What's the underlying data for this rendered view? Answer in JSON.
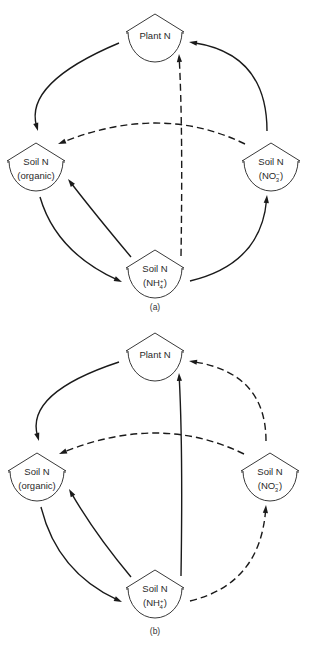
{
  "diagrams": [
    {
      "id": "a",
      "label": "(a)",
      "nodes": [
        {
          "id": "plant",
          "line1": "Plant N",
          "line2": ""
        },
        {
          "id": "organic",
          "line1": "Soil N",
          "line2": "(organic)"
        },
        {
          "id": "nitrate",
          "line1": "Soil N",
          "line2": "(NO",
          "ion_sup": "−",
          "ion_sub": "3",
          "line2_end": ")"
        },
        {
          "id": "ammonium",
          "line1": "Soil N",
          "line2": "(NH",
          "ion_sup": "+",
          "ion_sub": "4",
          "line2_end": ")"
        }
      ],
      "edges": [
        {
          "from": "plant",
          "to": "organic",
          "style": "solid"
        },
        {
          "from": "organic",
          "to": "ammonium",
          "style": "solid"
        },
        {
          "from": "ammonium",
          "to": "organic",
          "style": "solid"
        },
        {
          "from": "ammonium",
          "to": "nitrate",
          "style": "solid"
        },
        {
          "from": "nitrate",
          "to": "plant",
          "style": "solid"
        },
        {
          "from": "nitrate",
          "to": "organic",
          "style": "dashed"
        },
        {
          "from": "ammonium",
          "to": "plant",
          "style": "dashed"
        }
      ]
    },
    {
      "id": "b",
      "label": "(b)",
      "nodes": [
        {
          "id": "plant",
          "line1": "Plant N",
          "line2": ""
        },
        {
          "id": "organic",
          "line1": "Soil N",
          "line2": "(organic)"
        },
        {
          "id": "nitrate",
          "line1": "Soil N",
          "line2": "(NO",
          "ion_sup": "−",
          "ion_sub": "3",
          "line2_end": ")"
        },
        {
          "id": "ammonium",
          "line1": "Soil N",
          "line2": "(NH",
          "ion_sup": "+",
          "ion_sub": "4",
          "line2_end": ")"
        }
      ],
      "edges": [
        {
          "from": "plant",
          "to": "organic",
          "style": "solid"
        },
        {
          "from": "organic",
          "to": "ammonium",
          "style": "solid"
        },
        {
          "from": "ammonium",
          "to": "organic",
          "style": "solid"
        },
        {
          "from": "ammonium",
          "to": "nitrate",
          "style": "dashed"
        },
        {
          "from": "nitrate",
          "to": "plant",
          "style": "dashed"
        },
        {
          "from": "nitrate",
          "to": "organic",
          "style": "dashed"
        },
        {
          "from": "ammonium",
          "to": "plant",
          "style": "solid"
        }
      ]
    }
  ]
}
